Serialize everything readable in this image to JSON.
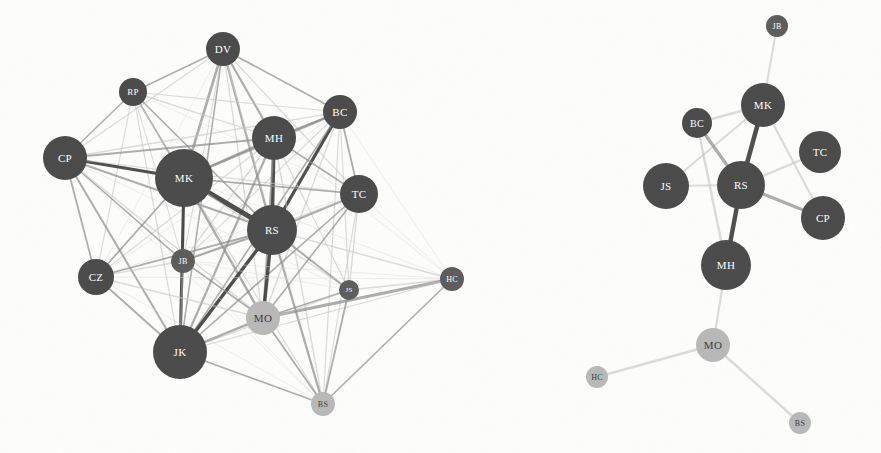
{
  "figure": {
    "background_color": "#fdfdfc",
    "panels": [
      {
        "id": "left-panel",
        "name": "dense-network",
        "description": "Dense weighted network graph with many interconnected edges"
      },
      {
        "id": "right-panel",
        "name": "sparse-network",
        "description": "Sparse backbone network graph with few edges"
      }
    ]
  },
  "colors": {
    "node_dark": "#4a4a4a",
    "node_mid": "#5c5c5c",
    "node_light": "#b8b8b8",
    "node_pale": "#c9c9c9",
    "edge_dark": "#3f3f3f",
    "edge_mid": "#8a8a8a",
    "edge_light": "#c4c4c4",
    "edge_faint": "#dcdcdc",
    "label_light": "#ffffff",
    "label_dark": "#3c3c3c",
    "background": "#fdfdfc"
  },
  "chart_data": {
    "type": "network",
    "title": "",
    "panels": [
      {
        "name": "Dense network",
        "layout": "force-directed",
        "nodes": [
          {
            "id": "DV",
            "label": "DV",
            "x": 223,
            "y": 49,
            "r": 17,
            "shade": "dark",
            "text": "light"
          },
          {
            "id": "RP",
            "label": "RP",
            "x": 133,
            "y": 92,
            "r": 14,
            "shade": "dark",
            "text": "light"
          },
          {
            "id": "BC",
            "label": "BC",
            "x": 340,
            "y": 112,
            "r": 17,
            "shade": "dark",
            "text": "light"
          },
          {
            "id": "MH",
            "label": "MH",
            "x": 274,
            "y": 138,
            "r": 22,
            "shade": "dark",
            "text": "light"
          },
          {
            "id": "CP",
            "label": "CP",
            "x": 65,
            "y": 158,
            "r": 22,
            "shade": "dark",
            "text": "light"
          },
          {
            "id": "MK",
            "label": "MK",
            "x": 184,
            "y": 178,
            "r": 29,
            "shade": "dark",
            "text": "light"
          },
          {
            "id": "TC",
            "label": "TC",
            "x": 359,
            "y": 194,
            "r": 19,
            "shade": "dark",
            "text": "light"
          },
          {
            "id": "RS",
            "label": "RS",
            "x": 272,
            "y": 230,
            "r": 25,
            "shade": "dark",
            "text": "light"
          },
          {
            "id": "JB",
            "label": "JB",
            "x": 183,
            "y": 261,
            "r": 12,
            "shade": "mid",
            "text": "light"
          },
          {
            "id": "CZ",
            "label": "CZ",
            "x": 96,
            "y": 277,
            "r": 18,
            "shade": "dark",
            "text": "light"
          },
          {
            "id": "HC",
            "label": "HC",
            "x": 452,
            "y": 279,
            "r": 12,
            "shade": "mid",
            "text": "light"
          },
          {
            "id": "JS",
            "label": "JS",
            "x": 349,
            "y": 290,
            "r": 10,
            "shade": "mid",
            "text": "light"
          },
          {
            "id": "MO",
            "label": "MO",
            "x": 263,
            "y": 318,
            "r": 17,
            "shade": "light",
            "text": "dark"
          },
          {
            "id": "JK",
            "label": "JK",
            "x": 180,
            "y": 352,
            "r": 27,
            "shade": "dark",
            "text": "light"
          },
          {
            "id": "BS",
            "label": "BS",
            "x": 323,
            "y": 404,
            "r": 12,
            "shade": "light",
            "text": "dark"
          }
        ],
        "edges": [
          {
            "s": "DV",
            "t": "RP",
            "w": 1.4,
            "tone": "mid"
          },
          {
            "s": "DV",
            "t": "BC",
            "w": 1.6,
            "tone": "mid"
          },
          {
            "s": "DV",
            "t": "MH",
            "w": 2.2,
            "tone": "mid"
          },
          {
            "s": "DV",
            "t": "CP",
            "w": 1.2,
            "tone": "light"
          },
          {
            "s": "DV",
            "t": "MK",
            "w": 2.6,
            "tone": "mid"
          },
          {
            "s": "DV",
            "t": "TC",
            "w": 1.2,
            "tone": "light"
          },
          {
            "s": "DV",
            "t": "RS",
            "w": 2.4,
            "tone": "mid"
          },
          {
            "s": "DV",
            "t": "JB",
            "w": 1.1,
            "tone": "light"
          },
          {
            "s": "DV",
            "t": "CZ",
            "w": 1.0,
            "tone": "faint"
          },
          {
            "s": "DV",
            "t": "MO",
            "w": 1.3,
            "tone": "light"
          },
          {
            "s": "DV",
            "t": "JK",
            "w": 1.6,
            "tone": "mid"
          },
          {
            "s": "DV",
            "t": "BS",
            "w": 0.9,
            "tone": "faint"
          },
          {
            "s": "RP",
            "t": "BC",
            "w": 1.1,
            "tone": "light"
          },
          {
            "s": "RP",
            "t": "MH",
            "w": 1.4,
            "tone": "light"
          },
          {
            "s": "RP",
            "t": "CP",
            "w": 1.4,
            "tone": "mid"
          },
          {
            "s": "RP",
            "t": "MK",
            "w": 1.8,
            "tone": "mid"
          },
          {
            "s": "RP",
            "t": "TC",
            "w": 1.0,
            "tone": "faint"
          },
          {
            "s": "RP",
            "t": "RS",
            "w": 1.6,
            "tone": "mid"
          },
          {
            "s": "RP",
            "t": "JB",
            "w": 1.0,
            "tone": "light"
          },
          {
            "s": "RP",
            "t": "CZ",
            "w": 1.2,
            "tone": "light"
          },
          {
            "s": "RP",
            "t": "MO",
            "w": 1.0,
            "tone": "faint"
          },
          {
            "s": "RP",
            "t": "JK",
            "w": 1.3,
            "tone": "light"
          },
          {
            "s": "BC",
            "t": "MH",
            "w": 2.0,
            "tone": "mid"
          },
          {
            "s": "BC",
            "t": "MK",
            "w": 2.4,
            "tone": "mid"
          },
          {
            "s": "BC",
            "t": "TC",
            "w": 1.8,
            "tone": "mid"
          },
          {
            "s": "BC",
            "t": "RS",
            "w": 3.2,
            "tone": "dark"
          },
          {
            "s": "BC",
            "t": "JB",
            "w": 1.1,
            "tone": "light"
          },
          {
            "s": "BC",
            "t": "CP",
            "w": 1.4,
            "tone": "light"
          },
          {
            "s": "BC",
            "t": "CZ",
            "w": 1.0,
            "tone": "faint"
          },
          {
            "s": "BC",
            "t": "HC",
            "w": 1.0,
            "tone": "faint"
          },
          {
            "s": "BC",
            "t": "JS",
            "w": 1.2,
            "tone": "light"
          },
          {
            "s": "BC",
            "t": "MO",
            "w": 1.4,
            "tone": "light"
          },
          {
            "s": "BC",
            "t": "JK",
            "w": 1.6,
            "tone": "mid"
          },
          {
            "s": "BC",
            "t": "BS",
            "w": 1.2,
            "tone": "light"
          },
          {
            "s": "MH",
            "t": "MK",
            "w": 2.2,
            "tone": "mid"
          },
          {
            "s": "MH",
            "t": "TC",
            "w": 1.6,
            "tone": "mid"
          },
          {
            "s": "MH",
            "t": "RS",
            "w": 3.6,
            "tone": "dark"
          },
          {
            "s": "MH",
            "t": "CP",
            "w": 2.0,
            "tone": "mid"
          },
          {
            "s": "MH",
            "t": "JB",
            "w": 1.4,
            "tone": "light"
          },
          {
            "s": "MH",
            "t": "CZ",
            "w": 1.2,
            "tone": "light"
          },
          {
            "s": "MH",
            "t": "MO",
            "w": 2.0,
            "tone": "mid"
          },
          {
            "s": "MH",
            "t": "JK",
            "w": 2.2,
            "tone": "mid"
          },
          {
            "s": "MH",
            "t": "JS",
            "w": 1.2,
            "tone": "light"
          },
          {
            "s": "MH",
            "t": "BS",
            "w": 1.4,
            "tone": "light"
          },
          {
            "s": "MH",
            "t": "HC",
            "w": 1.0,
            "tone": "faint"
          },
          {
            "s": "CP",
            "t": "MK",
            "w": 3.0,
            "tone": "dark"
          },
          {
            "s": "CP",
            "t": "RS",
            "w": 2.2,
            "tone": "mid"
          },
          {
            "s": "CP",
            "t": "TC",
            "w": 1.2,
            "tone": "light"
          },
          {
            "s": "CP",
            "t": "JB",
            "w": 1.6,
            "tone": "mid"
          },
          {
            "s": "CP",
            "t": "CZ",
            "w": 1.8,
            "tone": "mid"
          },
          {
            "s": "CP",
            "t": "MO",
            "w": 1.4,
            "tone": "light"
          },
          {
            "s": "CP",
            "t": "JK",
            "w": 2.0,
            "tone": "mid"
          },
          {
            "s": "CP",
            "t": "JS",
            "w": 1.0,
            "tone": "faint"
          },
          {
            "s": "CP",
            "t": "BS",
            "w": 1.0,
            "tone": "faint"
          },
          {
            "s": "MK",
            "t": "RS",
            "w": 5.0,
            "tone": "dark"
          },
          {
            "s": "MK",
            "t": "TC",
            "w": 1.6,
            "tone": "mid"
          },
          {
            "s": "MK",
            "t": "JB",
            "w": 2.0,
            "tone": "mid"
          },
          {
            "s": "MK",
            "t": "CZ",
            "w": 1.8,
            "tone": "mid"
          },
          {
            "s": "MK",
            "t": "MO",
            "w": 2.4,
            "tone": "mid"
          },
          {
            "s": "MK",
            "t": "JK",
            "w": 3.0,
            "tone": "dark"
          },
          {
            "s": "MK",
            "t": "JS",
            "w": 1.4,
            "tone": "light"
          },
          {
            "s": "MK",
            "t": "BS",
            "w": 1.2,
            "tone": "light"
          },
          {
            "s": "MK",
            "t": "HC",
            "w": 1.0,
            "tone": "faint"
          },
          {
            "s": "TC",
            "t": "RS",
            "w": 2.2,
            "tone": "mid"
          },
          {
            "s": "TC",
            "t": "JB",
            "w": 1.2,
            "tone": "light"
          },
          {
            "s": "TC",
            "t": "MO",
            "w": 1.6,
            "tone": "mid"
          },
          {
            "s": "TC",
            "t": "JK",
            "w": 1.6,
            "tone": "mid"
          },
          {
            "s": "TC",
            "t": "JS",
            "w": 1.4,
            "tone": "light"
          },
          {
            "s": "TC",
            "t": "BS",
            "w": 1.2,
            "tone": "light"
          },
          {
            "s": "TC",
            "t": "HC",
            "w": 1.0,
            "tone": "faint"
          },
          {
            "s": "TC",
            "t": "CZ",
            "w": 1.0,
            "tone": "faint"
          },
          {
            "s": "RS",
            "t": "JB",
            "w": 2.0,
            "tone": "mid"
          },
          {
            "s": "RS",
            "t": "CZ",
            "w": 1.8,
            "tone": "mid"
          },
          {
            "s": "RS",
            "t": "MO",
            "w": 3.4,
            "tone": "dark"
          },
          {
            "s": "RS",
            "t": "JK",
            "w": 3.4,
            "tone": "dark"
          },
          {
            "s": "RS",
            "t": "JS",
            "w": 2.0,
            "tone": "mid"
          },
          {
            "s": "RS",
            "t": "BS",
            "w": 2.2,
            "tone": "mid"
          },
          {
            "s": "RS",
            "t": "HC",
            "w": 1.4,
            "tone": "light"
          },
          {
            "s": "JB",
            "t": "CZ",
            "w": 1.4,
            "tone": "light"
          },
          {
            "s": "JB",
            "t": "MO",
            "w": 1.6,
            "tone": "mid"
          },
          {
            "s": "JB",
            "t": "JK",
            "w": 2.0,
            "tone": "mid"
          },
          {
            "s": "JB",
            "t": "JS",
            "w": 1.0,
            "tone": "faint"
          },
          {
            "s": "JB",
            "t": "HC",
            "w": 1.0,
            "tone": "faint"
          },
          {
            "s": "JB",
            "t": "BS",
            "w": 1.0,
            "tone": "faint"
          },
          {
            "s": "CZ",
            "t": "MO",
            "w": 1.4,
            "tone": "light"
          },
          {
            "s": "CZ",
            "t": "JK",
            "w": 1.8,
            "tone": "mid"
          },
          {
            "s": "CZ",
            "t": "HC",
            "w": 1.0,
            "tone": "faint"
          },
          {
            "s": "CZ",
            "t": "BS",
            "w": 1.0,
            "tone": "faint"
          },
          {
            "s": "HC",
            "t": "JS",
            "w": 1.4,
            "tone": "light"
          },
          {
            "s": "HC",
            "t": "MO",
            "w": 3.0,
            "tone": "mid"
          },
          {
            "s": "HC",
            "t": "JK",
            "w": 1.2,
            "tone": "light"
          },
          {
            "s": "HC",
            "t": "BS",
            "w": 1.6,
            "tone": "mid"
          },
          {
            "s": "JS",
            "t": "MO",
            "w": 1.6,
            "tone": "mid"
          },
          {
            "s": "JS",
            "t": "JK",
            "w": 1.2,
            "tone": "light"
          },
          {
            "s": "JS",
            "t": "BS",
            "w": 1.8,
            "tone": "mid"
          },
          {
            "s": "MO",
            "t": "JK",
            "w": 2.4,
            "tone": "mid"
          },
          {
            "s": "MO",
            "t": "BS",
            "w": 1.8,
            "tone": "mid"
          },
          {
            "s": "JK",
            "t": "BS",
            "w": 1.6,
            "tone": "mid"
          }
        ]
      },
      {
        "name": "Sparse network",
        "layout": "force-directed",
        "nodes": [
          {
            "id": "JB",
            "label": "JB",
            "x": 777,
            "y": 26,
            "r": 11,
            "shade": "mid",
            "text": "light"
          },
          {
            "id": "MK",
            "label": "MK",
            "x": 763,
            "y": 105,
            "r": 22,
            "shade": "dark",
            "text": "light"
          },
          {
            "id": "BC",
            "label": "BC",
            "x": 697,
            "y": 123,
            "r": 15,
            "shade": "dark",
            "text": "light"
          },
          {
            "id": "TC",
            "label": "TC",
            "x": 820,
            "y": 152,
            "r": 21,
            "shade": "dark",
            "text": "light"
          },
          {
            "id": "JS",
            "label": "JS",
            "x": 666,
            "y": 186,
            "r": 23,
            "shade": "dark",
            "text": "light"
          },
          {
            "id": "RS",
            "label": "RS",
            "x": 741,
            "y": 185,
            "r": 24,
            "shade": "dark",
            "text": "light"
          },
          {
            "id": "CP",
            "label": "CP",
            "x": 823,
            "y": 218,
            "r": 22,
            "shade": "dark",
            "text": "light"
          },
          {
            "id": "MH",
            "label": "MH",
            "x": 726,
            "y": 265,
            "r": 25,
            "shade": "dark",
            "text": "light"
          },
          {
            "id": "MO",
            "label": "MO",
            "x": 713,
            "y": 345,
            "r": 17,
            "shade": "light",
            "text": "dark"
          },
          {
            "id": "HC",
            "label": "HC",
            "x": 597,
            "y": 377,
            "r": 11,
            "shade": "light",
            "text": "dark"
          },
          {
            "id": "BS",
            "label": "BS",
            "x": 800,
            "y": 423,
            "r": 11,
            "shade": "light",
            "text": "dark"
          }
        ],
        "edges": [
          {
            "s": "JB",
            "t": "MK",
            "w": 2.0,
            "tone": "light"
          },
          {
            "s": "MK",
            "t": "BC",
            "w": 2.4,
            "tone": "light"
          },
          {
            "s": "MK",
            "t": "RS",
            "w": 4.6,
            "tone": "dark"
          },
          {
            "s": "MK",
            "t": "CP",
            "w": 2.2,
            "tone": "light"
          },
          {
            "s": "MK",
            "t": "JS",
            "w": 2.0,
            "tone": "light"
          },
          {
            "s": "BC",
            "t": "RS",
            "w": 3.2,
            "tone": "mid"
          },
          {
            "s": "BC",
            "t": "MH",
            "w": 2.4,
            "tone": "light"
          },
          {
            "s": "RS",
            "t": "JS",
            "w": 2.2,
            "tone": "light"
          },
          {
            "s": "RS",
            "t": "TC",
            "w": 2.2,
            "tone": "light"
          },
          {
            "s": "RS",
            "t": "CP",
            "w": 3.2,
            "tone": "mid"
          },
          {
            "s": "RS",
            "t": "MH",
            "w": 4.4,
            "tone": "dark"
          },
          {
            "s": "MH",
            "t": "MO",
            "w": 2.2,
            "tone": "light"
          },
          {
            "s": "MO",
            "t": "HC",
            "w": 2.4,
            "tone": "light"
          },
          {
            "s": "MO",
            "t": "BS",
            "w": 2.4,
            "tone": "light"
          }
        ]
      }
    ]
  }
}
